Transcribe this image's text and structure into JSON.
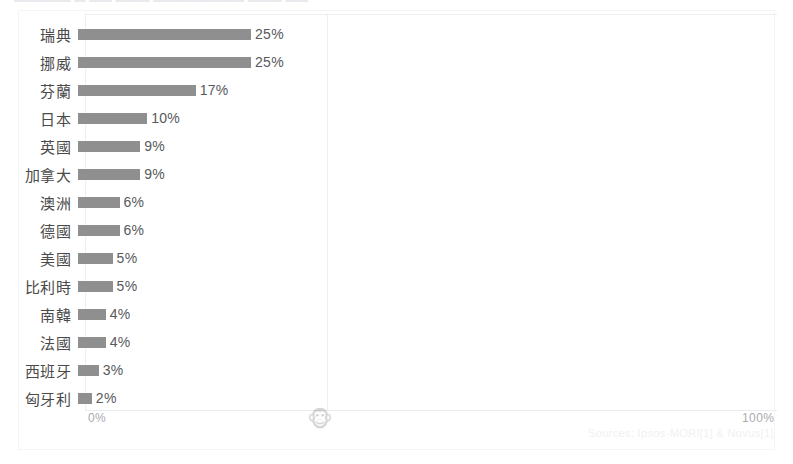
{
  "page": {
    "background_color": "#ffffff",
    "top_cropped_text": "▬▬▬▬▬  ▬  ▬▬ ▬▬▬  ▬▬▬▬▬▬▬▬  ▬▬▬  ▬▬"
  },
  "watermark": {
    "icon": "monkey-face-icon",
    "glyph": "🐵"
  },
  "credit": {
    "text": "Sources: Ipsos-MORI[1] & Novus[1]"
  },
  "colors": {
    "bar": "#8f8f8f",
    "value_label": "#58595b",
    "category_label": "#4a4a4a",
    "axis_label": "#a9abae",
    "gridline": "#eceef0",
    "frame": "#f4f5f7"
  },
  "chart_data": {
    "type": "bar",
    "orientation": "horizontal",
    "title": "",
    "subtitle": "",
    "xlabel": "",
    "ylabel": "",
    "xlim": [
      0,
      100
    ],
    "grid": true,
    "gridlines_at": [
      35
    ],
    "legend": null,
    "legend_position": "none",
    "axis_ticks": [
      "0%",
      "100%"
    ],
    "value_suffix": "%",
    "categories": [
      "瑞典",
      "挪威",
      "芬蘭",
      "日本",
      "英國",
      "加拿大",
      "澳洲",
      "德國",
      "美國",
      "比利時",
      "南韓",
      "法國",
      "西班牙",
      "匈牙利"
    ],
    "values": [
      25,
      25,
      17,
      10,
      9,
      9,
      6,
      6,
      5,
      5,
      4,
      4,
      3,
      2
    ],
    "value_labels": [
      "25%",
      "25%",
      "17%",
      "10%",
      "9%",
      "9%",
      "6%",
      "6%",
      "5%",
      "5%",
      "4%",
      "4%",
      "3%",
      "2%"
    ]
  }
}
